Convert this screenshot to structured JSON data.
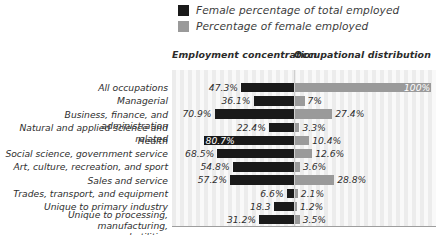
{
  "legend": {
    "items": [
      {
        "label": "Female percentage of total employed",
        "color": "#1a1a1a",
        "key": "female_pct_of_total_employed"
      },
      {
        "label": "Percentage of female employed",
        "color": "#9a9a9a",
        "key": "pct_of_female_employed"
      }
    ]
  },
  "headers": {
    "left": "Employment concentration",
    "right": "Occupational distribution"
  },
  "chart_data": {
    "type": "bar",
    "orientation": "horizontal-diverging",
    "title": "",
    "xlabel": "",
    "ylabel": "",
    "grid": true,
    "legend_position": "top",
    "axis_center_label": "Employment concentration | Occupational distribution",
    "categories": [
      "All occupations",
      "Managerial",
      "Business, finance, and administration",
      "Natural and applied science and related",
      "Health",
      "Social science, government service",
      "Art, culture, recreation, and sport",
      "Sales and service",
      "Trades, transport, and equipment",
      "Unique to primary industry",
      "Unique to processing, manufacturing,\nand utilities"
    ],
    "series": [
      {
        "name": "Female percentage of total employed",
        "color": "#1a1a1a",
        "direction": "left",
        "values": [
          47.3,
          36.1,
          70.9,
          22.4,
          80.7,
          68.5,
          54.8,
          57.2,
          6.6,
          18.3,
          31.2
        ],
        "labels": [
          "47.3%",
          "36.1%",
          "70.9%",
          "22.4%",
          "80.7%",
          "68.5%",
          "54.8%",
          "57.2%",
          "6.6%",
          "18.3",
          "31.2%"
        ]
      },
      {
        "name": "Percentage of female employed",
        "color": "#9a9a9a",
        "direction": "right",
        "values": [
          100,
          7,
          27.4,
          3.3,
          10.4,
          12.6,
          3.6,
          28.8,
          2.1,
          1.2,
          3.5
        ],
        "labels": [
          "100%",
          "7%",
          "27.4%",
          "3.3%",
          "10.4%",
          "12.6%",
          "3.6%",
          "28.8%",
          "2.1%",
          "1.2%",
          "3.5%"
        ]
      }
    ]
  },
  "rows": [
    {
      "category": "All occupations",
      "left_label": "47.3%",
      "left_value": 47.3,
      "right_label": "100%",
      "right_value": 100,
      "left_label_inside": false,
      "right_label_inside": true
    },
    {
      "category": "Managerial",
      "left_label": "36.1%",
      "left_value": 36.1,
      "right_label": "7%",
      "right_value": 7,
      "left_label_inside": false,
      "right_label_inside": false
    },
    {
      "category": "Business, finance, and administration",
      "left_label": "70.9%",
      "left_value": 70.9,
      "right_label": "27.4%",
      "right_value": 27.4,
      "left_label_inside": false,
      "right_label_inside": false
    },
    {
      "category": "Natural and applied science and related",
      "left_label": "22.4%",
      "left_value": 22.4,
      "right_label": "3.3%",
      "right_value": 3.3,
      "left_label_inside": false,
      "right_label_inside": false
    },
    {
      "category": "Health",
      "left_label": "80.7%",
      "left_value": 80.7,
      "right_label": "10.4%",
      "right_value": 10.4,
      "left_label_inside": true,
      "right_label_inside": false
    },
    {
      "category": "Social science, government service",
      "left_label": "68.5%",
      "left_value": 68.5,
      "right_label": "12.6%",
      "right_value": 12.6,
      "left_label_inside": false,
      "right_label_inside": false
    },
    {
      "category": "Art, culture, recreation, and sport",
      "left_label": "54.8%",
      "left_value": 54.8,
      "right_label": "3.6%",
      "right_value": 3.6,
      "left_label_inside": false,
      "right_label_inside": false
    },
    {
      "category": "Sales and service",
      "left_label": "57.2%",
      "left_value": 57.2,
      "right_label": "28.8%",
      "right_value": 28.8,
      "left_label_inside": false,
      "right_label_inside": false
    },
    {
      "category": "Trades, transport, and equipment",
      "left_label": "6.6%",
      "left_value": 6.6,
      "right_label": "2.1%",
      "right_value": 2.1,
      "left_label_inside": false,
      "right_label_inside": false
    },
    {
      "category": "Unique to primary industry",
      "left_label": "18.3",
      "left_value": 18.3,
      "right_label": "1.2%",
      "right_value": 1.2,
      "left_label_inside": false,
      "right_label_inside": false
    },
    {
      "category": "Unique to processing, manufacturing,\nand utilities",
      "left_label": "31.2%",
      "left_value": 31.2,
      "right_label": "3.5%",
      "right_value": 3.5,
      "left_label_inside": false,
      "right_label_inside": false
    }
  ]
}
